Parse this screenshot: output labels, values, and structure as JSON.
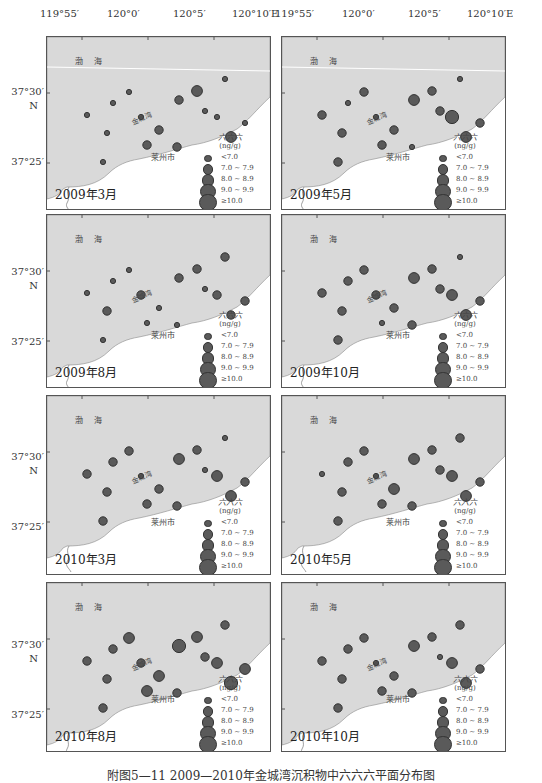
{
  "figure": {
    "caption": "附图5—11  2009—2010年金城湾沉积物中六六六平面分布图",
    "lon_labels": [
      "119°55′",
      "120°0′",
      "120°5′",
      "120°10′E"
    ],
    "lat_labels": [
      "37°30′",
      "N",
      "37°25′"
    ],
    "map_labels": {
      "sea": "渤 海",
      "bay": "金城湾",
      "city": "莱州市"
    },
    "legend": {
      "title": "六六六",
      "unit": "(ng/g)",
      "classes": [
        "<7.0",
        "7.0 ~ 7.9",
        "8.0 ~ 8.9",
        "9.0 ~ 9.9",
        "≥10.0"
      ]
    },
    "colors": {
      "sea": "#d9d9d9",
      "land": "#ffffff",
      "dot_fill": "#5a5a5a",
      "dot_stroke": "#333333",
      "frame": "#555555"
    }
  },
  "panels": [
    {
      "title": "2009年3月"
    },
    {
      "title": "2009年5月"
    },
    {
      "title": "2009年8月"
    },
    {
      "title": "2009年10月"
    },
    {
      "title": "2010年3月"
    },
    {
      "title": "2010年5月"
    },
    {
      "title": "2010年8月"
    },
    {
      "title": "2010年10月"
    }
  ],
  "chart_data": {
    "type": "scatter",
    "title": "附图5—11  2009—2010年金城湾沉积物中六六六平面分布图",
    "xlabel": "Longitude (E)",
    "ylabel": "Latitude (N)",
    "x_ticks": [
      "119°55′",
      "120°0′",
      "120°5′",
      "120°10′E"
    ],
    "y_ticks": [
      "37°25′",
      "37°30′"
    ],
    "size_classes": [
      "<7.0",
      "7.0~7.9",
      "8.0~8.9",
      "9.0~9.9",
      "≥10.0"
    ],
    "unit": "ng/g",
    "series": [
      {
        "name": "2009年3月",
        "stations_class_index": [
          0,
          0,
          0,
          0,
          0,
          0,
          1,
          1,
          1,
          1,
          2,
          0,
          0,
          0,
          2,
          0
        ]
      },
      {
        "name": "2009年5月",
        "stations_class_index": [
          1,
          1,
          1,
          0,
          1,
          0,
          1,
          1,
          2,
          0,
          1,
          1,
          3,
          0,
          2,
          1
        ]
      },
      {
        "name": "2009年8月",
        "stations_class_index": [
          0,
          1,
          0,
          0,
          0,
          1,
          0,
          0,
          1,
          0,
          1,
          0,
          1,
          1,
          1,
          1
        ]
      },
      {
        "name": "2009年10月",
        "stations_class_index": [
          1,
          1,
          1,
          1,
          1,
          1,
          0,
          1,
          2,
          1,
          1,
          1,
          2,
          0,
          2,
          1
        ]
      },
      {
        "name": "2010年3月",
        "stations_class_index": [
          1,
          1,
          1,
          1,
          1,
          0,
          1,
          1,
          2,
          1,
          1,
          0,
          2,
          0,
          2,
          1
        ]
      },
      {
        "name": "2010年5月",
        "stations_class_index": [
          0,
          1,
          1,
          1,
          1,
          0,
          1,
          2,
          2,
          1,
          1,
          1,
          2,
          1,
          2,
          1
        ]
      },
      {
        "name": "2010年8月",
        "stations_class_index": [
          1,
          1,
          1,
          1,
          2,
          1,
          2,
          2,
          3,
          1,
          2,
          1,
          2,
          1,
          3,
          2
        ]
      },
      {
        "name": "2010年10月",
        "stations_class_index": [
          1,
          1,
          1,
          1,
          1,
          0,
          1,
          1,
          2,
          1,
          1,
          0,
          2,
          1,
          2,
          1
        ]
      }
    ]
  }
}
